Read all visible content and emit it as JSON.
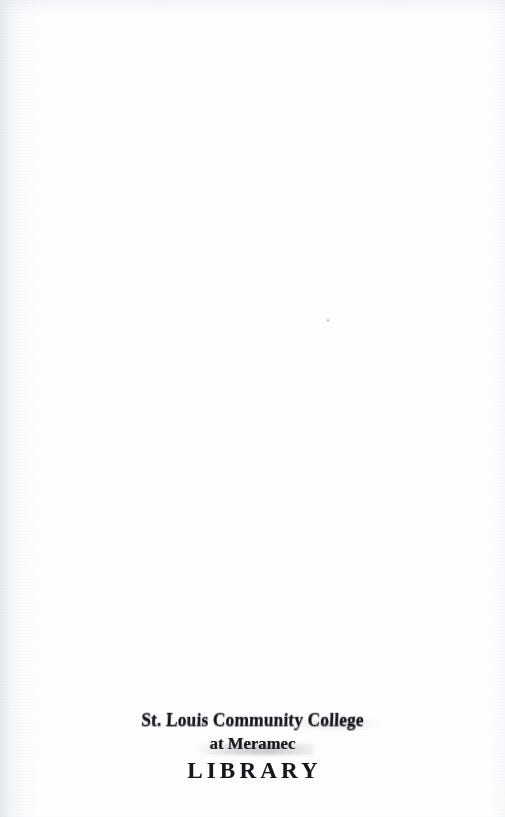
{
  "page": {
    "kind": "scanned-book-page",
    "width": 505,
    "height": 817,
    "paper_color": "#fdfdfe",
    "ink_color": "#15161c",
    "gutter_shadow_color": "#cdd6e2"
  },
  "library_stamp": {
    "institution": "St. Louis Community College",
    "campus": "at Meramec",
    "department": "LIBRARY",
    "ink_color": "#15161c"
  },
  "showthrough": {
    "note": "Illegible ghost text bleeding through from the reverse side of the leaf",
    "title_ghost": "           ",
    "subtitle_ghost_a": "       ",
    "subtitle_ghost_b": "      ",
    "footer_ghost": "        "
  }
}
